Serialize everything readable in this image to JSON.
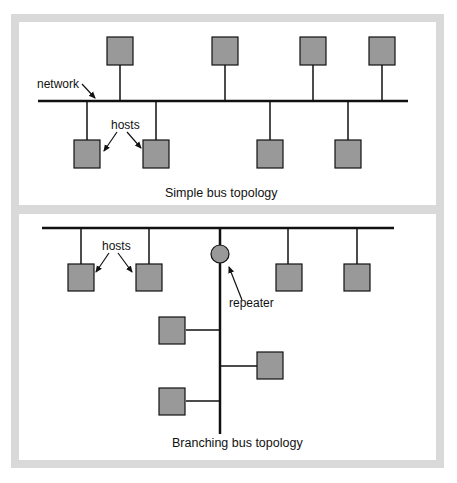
{
  "figure": {
    "panels": [
      {
        "caption": "Simple bus topology",
        "labels": {
          "network": "network",
          "hosts": "hosts"
        },
        "host_count": 8,
        "hosts_above_bus": 4,
        "hosts_below_bus": 4
      },
      {
        "caption": "Branching bus topology",
        "labels": {
          "hosts": "hosts",
          "repeater": "repeater"
        },
        "host_count": 7,
        "hosts_on_main_bus": 4,
        "hosts_on_branch": 3,
        "repeater_count": 1
      }
    ],
    "colors": {
      "frame": "#d9d9d9",
      "host_fill": "#999999",
      "line": "#111111",
      "background": "#ffffff"
    }
  }
}
